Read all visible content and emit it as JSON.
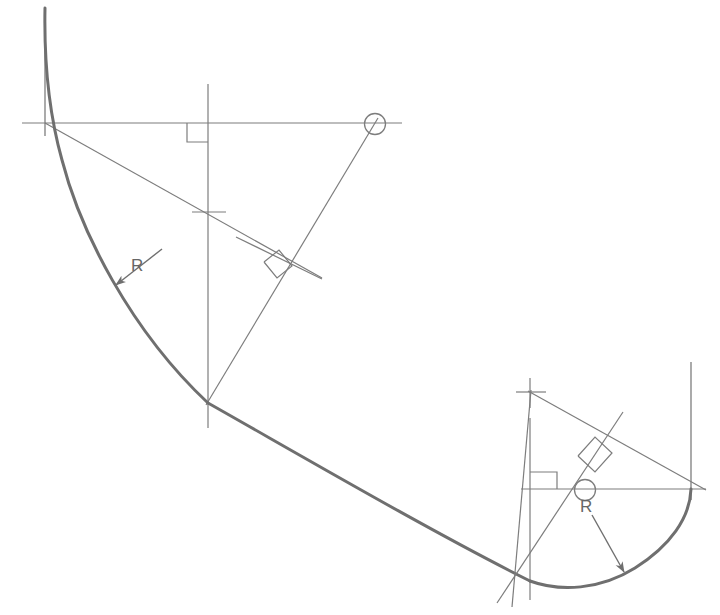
{
  "drawing": {
    "title": "Tangent arc construction layout",
    "background_color": "#ffffff",
    "stroke_color_thin": "#7d7d7d",
    "stroke_color_thick": "#6f6f6f",
    "label_color": "#666666",
    "canvas": {
      "width": 720,
      "height": 615
    }
  },
  "labels": {
    "radius_left": "R",
    "radius_right": "R"
  },
  "icons": {
    "center_mark_left": "center-cross-icon",
    "center_mark_right": "center-cross-icon",
    "diameter_symbol_top": "diameter-circle-icon",
    "diameter_symbol_bottom": "diameter-circle-icon",
    "right_angle_top": "right-angle-icon",
    "right_angle_middle": "right-angle-icon",
    "right_angle_lower_left": "right-angle-icon",
    "right_angle_lower_right": "right-angle-icon",
    "leader_arrow_left": "arrowhead-icon",
    "leader_arrow_right": "arrowhead-icon"
  },
  "geometry": {
    "arc_left": {
      "center": [
        208,
        212
      ],
      "radius": 193,
      "start_point": [
        45,
        123
      ],
      "end_point": [
        208,
        403
      ],
      "start_angle_deg": 208.6,
      "end_angle_deg": 90.0
    },
    "arc_right": {
      "center": [
        585,
        490
      ],
      "radius": 106,
      "start_point": [
        530,
        581
      ],
      "end_point": [
        691,
        489
      ],
      "start_angle_deg": 121.0,
      "end_angle_deg": 0.0
    },
    "straight_tangent": {
      "from": [
        208,
        403
      ],
      "to": [
        530,
        581
      ]
    },
    "horizontal_construction_line_top": {
      "from": [
        22,
        123
      ],
      "to": [
        402,
        123
      ],
      "y": 123
    },
    "horizontal_construction_line_bottom": {
      "from": [
        521,
        489
      ],
      "to": [
        706,
        489
      ],
      "y": 489
    },
    "vertical_construction_line_left_edge": {
      "x": 45,
      "from_y": 8,
      "to_y": 135
    },
    "vertical_center_line_left": {
      "x": 208,
      "from_y": 84,
      "to_y": 428
    },
    "vertical_center_line_right": {
      "x": 530,
      "from_y": 383,
      "to_y": 600
    },
    "vertical_construction_line_right_edge": {
      "x": 691,
      "from_y": 362,
      "to_y": 500
    },
    "radius_line_left_upper": {
      "from": [
        45,
        123
      ],
      "to": [
        322,
        278
      ]
    },
    "radius_line_left_lower": {
      "from": [
        208,
        403
      ],
      "to": [
        375,
        124
      ]
    },
    "radius_line_right_upper": {
      "from": [
        530,
        392
      ],
      "to": [
        706,
        489
      ]
    },
    "radius_line_right_lower": {
      "from": [
        530,
        392
      ],
      "to": [
        516,
        600
      ]
    },
    "radius_line_right_diag": {
      "from": [
        498,
        601
      ],
      "to": [
        620,
        415
      ]
    },
    "leader_left": {
      "from": [
        160,
        250
      ],
      "to": [
        108,
        290
      ]
    },
    "leader_right": {
      "from": [
        592,
        513
      ],
      "to": [
        628,
        578
      ]
    }
  }
}
